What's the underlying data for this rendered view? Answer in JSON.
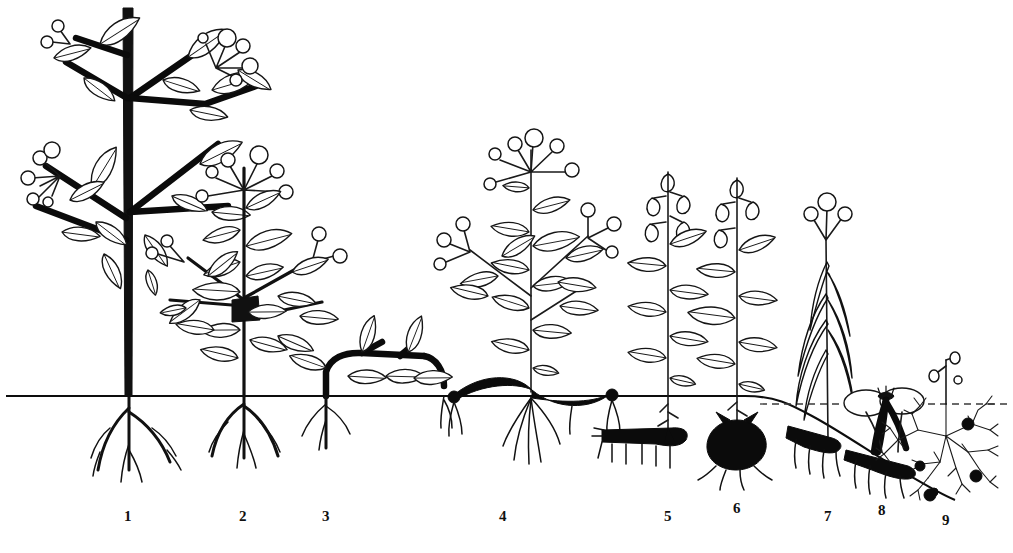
{
  "figure": {
    "ground_label": "soil-surface-line",
    "water_label": "water-surface-line",
    "ink_color": "#111111",
    "background_color": "#ffffff"
  },
  "axis": {
    "ground_line_y": 396,
    "water_line_y": 404,
    "canvas_width": 1013,
    "canvas_height": 553
  },
  "labels": [
    {
      "text": "1",
      "x": 128,
      "plant": "tall-woody-shrub"
    },
    {
      "text": "2",
      "x": 243,
      "plant": "low-woody-shrub"
    },
    {
      "text": "3",
      "x": 326,
      "plant": "prostrate-creeping-shrub"
    },
    {
      "text": "4",
      "x": 503,
      "plant": "erect-herb-with-rhizome"
    },
    {
      "text": "5",
      "x": 668,
      "plant": "herb-with-horizontal-rhizome"
    },
    {
      "text": "6",
      "x": 737,
      "plant": "herb-with-bulb"
    },
    {
      "text": "7",
      "x": 828,
      "plant": "grass-like-marsh-herb"
    },
    {
      "text": "8",
      "x": 882,
      "plant": "floating-leaved-aquatic"
    },
    {
      "text": "9",
      "x": 946,
      "plant": "submerged-aquatic"
    }
  ],
  "plants": [
    {
      "number": "1",
      "name": "tall-woody-shrub",
      "habit": "erect woody stem, branched, deciduous leaves and berry clusters",
      "height_px": 396,
      "stem_base_x": 128,
      "organ_below_ground": "taproot with lateral branches"
    },
    {
      "number": "2",
      "name": "low-woody-shrub",
      "habit": "low branching shrub with lanceolate leaves and terminal berries",
      "height_px": 240,
      "stem_base_x": 243,
      "organ_below_ground": "fibrous root system"
    },
    {
      "number": "3",
      "name": "prostrate-creeping-shrub",
      "habit": "stem creeping along the soil surface, leaves held just above ground",
      "height_px": 70,
      "stem_base_x": 326,
      "organ_below_ground": "short root at node"
    },
    {
      "number": "4",
      "name": "erect-herb-with-rhizome",
      "habit": "erect leafy shoot from a horizontal surface rhizome, umbel of buds",
      "height_px": 250,
      "stem_base_x": 530,
      "organ_below_ground": "surface runner / rhizome with fibrous roots"
    },
    {
      "number": "5",
      "name": "herb-with-horizontal-rhizome",
      "habit": "single leafy shoot with pendulous flowers from a buried rhizome",
      "height_px": 230,
      "stem_base_x": 668,
      "organ_below_ground": "horizontal subterranean rhizome with rootlets"
    },
    {
      "number": "6",
      "name": "herb-with-bulb",
      "habit": "single leafy shoot with pendulous flowers from a bulb",
      "height_px": 225,
      "stem_base_x": 737,
      "organ_below_ground": "rounded bulb with basal roots"
    },
    {
      "number": "7",
      "name": "grass-like-marsh-herb",
      "habit": "narrow grass-like leaves, three-flowered terminal cluster",
      "height_px": 200,
      "stem_base_x": 828,
      "organ_below_ground": "buried rhizome with rootlets"
    },
    {
      "number": "8",
      "name": "floating-leaved-aquatic",
      "habit": "floating oval leaves on the water surface, flower at surface",
      "height_px": 40,
      "stem_base_x": 882,
      "organ_below_ground": "rhizome in pond bottom with rootlets"
    },
    {
      "number": "9",
      "name": "submerged-aquatic",
      "habit": "free-floating finely dissected shoot with bladders, flower stalk above water",
      "height_px": 60,
      "stem_base_x": 946,
      "organ_below_ground": "none — free floating, detached turion on bottom"
    }
  ]
}
